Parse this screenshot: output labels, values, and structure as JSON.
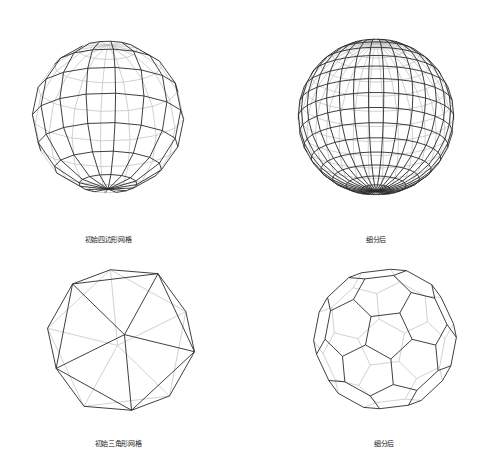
{
  "figure": {
    "panels": [
      {
        "id": "initial-quad",
        "caption": "初始四边形网格",
        "mesh": "quad",
        "latitude_bands": 8,
        "longitude_segments": 16
      },
      {
        "id": "subdivided-quad",
        "caption": "细分后",
        "mesh": "quad",
        "latitude_bands": 16,
        "longitude_segments": 32
      },
      {
        "id": "initial-tri",
        "caption": "初始三角形网格",
        "mesh": "icosahedron"
      },
      {
        "id": "subdivided-tri",
        "caption": "细分后",
        "mesh": "subdivided-polyhedron"
      }
    ],
    "colors": {
      "front_edges": "#2a2a2a",
      "back_edges": "#bdbdbd",
      "background": "#ffffff"
    }
  }
}
